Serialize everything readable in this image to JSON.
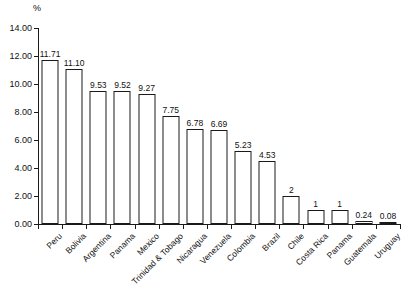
{
  "chart_data": {
    "type": "bar",
    "title": "",
    "subtitle": "",
    "xlabel": "",
    "ylabel": "%",
    "unit_label": "%",
    "ylim": [
      0,
      14
    ],
    "ytick_step": 2,
    "ytick_labels": [
      "0.00",
      "2.00",
      "4.00",
      "6.00",
      "8.00",
      "10.00",
      "12.00",
      "14.00"
    ],
    "ytick_values": [
      0,
      2,
      4,
      6,
      8,
      10,
      12,
      14
    ],
    "grid": false,
    "legend": null,
    "bar_style": {
      "fill": "#ffffff",
      "stroke": "#1a1a1a"
    },
    "categories": [
      "Peru",
      "Bolivia",
      "Argentina",
      "Panama",
      "Mexico",
      "Trinidad & Tobago",
      "Nicaragua",
      "Venezuela",
      "Colombia",
      "Brazil",
      "Chile",
      "Costa Rica",
      "Panama",
      "Guatemala",
      "Uruguay"
    ],
    "values": [
      11.71,
      11.1,
      9.53,
      9.52,
      9.27,
      7.75,
      6.78,
      6.69,
      5.23,
      4.53,
      2,
      1,
      1,
      0.24,
      0.08
    ],
    "value_labels": [
      "11.71",
      "11.10",
      "9.53",
      "9.52",
      "9.27",
      "7.75",
      "6.78",
      "6.69",
      "5.23",
      "4.53",
      "2",
      "1",
      "1",
      "0.24",
      "0.08"
    ]
  }
}
